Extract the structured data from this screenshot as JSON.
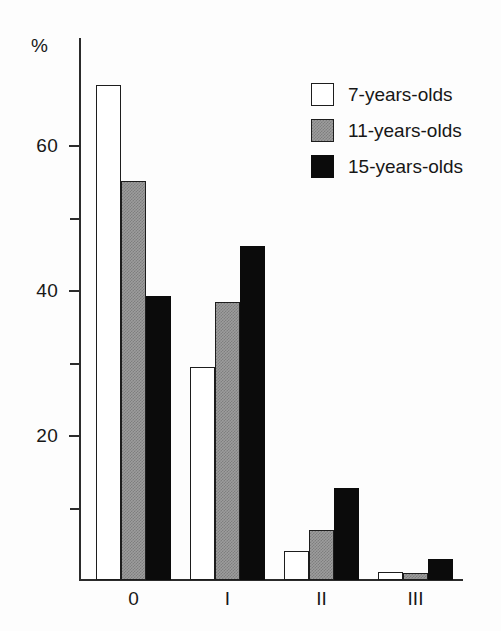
{
  "chart_data": {
    "type": "bar",
    "title": "",
    "subtitle": "",
    "xlabel": "",
    "ylabel": "%",
    "categories": [
      "0",
      "I",
      "II",
      "III"
    ],
    "series": [
      {
        "name": "7-years-olds",
        "swatch": "white",
        "color": "#ffffff",
        "values": [
          68.3,
          29.4,
          4.0,
          1.1
        ]
      },
      {
        "name": "11-years-olds",
        "swatch": "gray",
        "color": "#9d9d9d",
        "values": [
          55.0,
          38.3,
          6.9,
          1.0
        ]
      },
      {
        "name": "15-years-olds",
        "swatch": "black",
        "color": "#0b0b0b",
        "values": [
          39.2,
          46.1,
          12.7,
          2.9
        ]
      }
    ],
    "ylim": [
      0,
      70
    ],
    "y_major_ticks": [
      20,
      40,
      60
    ],
    "y_minor_ticks": [
      10,
      30,
      50
    ],
    "y_tick_labels": [
      "20",
      "40",
      "60"
    ],
    "grid": false,
    "legend_position": "top-right"
  },
  "axis": {
    "y_title": "%",
    "y_labels": [
      {
        "text": "60",
        "value": 60
      },
      {
        "text": "40",
        "value": 40
      },
      {
        "text": "20",
        "value": 20
      }
    ],
    "x_labels": [
      "0",
      "I",
      "II",
      "III"
    ]
  },
  "legend": {
    "items": [
      {
        "label": "7-years-olds",
        "style": "white"
      },
      {
        "label": "11-years-olds",
        "style": "gray"
      },
      {
        "label": "15-years-olds",
        "style": "black"
      }
    ]
  }
}
